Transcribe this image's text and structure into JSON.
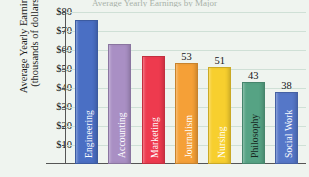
{
  "title_sliver": "Average Yearly Earnings by Major",
  "axis": {
    "ylabel_line1": "Average Yearly Earnings",
    "ylabel_line2": "(thousands of dollars)",
    "yticks": [
      "$80",
      "$70",
      "$60",
      "$50",
      "$40",
      "$30",
      "$20",
      "$10"
    ]
  },
  "chart_data": {
    "type": "bar",
    "title": "Average Yearly Earnings by Major",
    "xlabel": "",
    "ylabel": "Average Yearly Earnings (thousands of dollars)",
    "ylim": [
      0,
      80
    ],
    "ytick_values": [
      10,
      20,
      30,
      40,
      50,
      60,
      70,
      80
    ],
    "ytick_labels": [
      "$10",
      "$20",
      "$30",
      "$40",
      "$50",
      "$60",
      "$70",
      "$80"
    ],
    "grid": true,
    "legend": "none",
    "categories": [
      "Engineering",
      "Accounting",
      "Marketing",
      "Journalism",
      "Nursing",
      "Philosophy",
      "Social Work"
    ],
    "values": [
      76,
      63,
      57,
      53,
      51,
      43,
      38
    ],
    "value_labels": [
      "",
      "",
      "",
      "53",
      "51",
      "43",
      "38"
    ],
    "colors": [
      "#4a6fc4",
      "#a98fc4",
      "#ee3a4e",
      "#f5a037",
      "#f7cf2e",
      "#56a384",
      "#5577c8"
    ],
    "label_colors": [
      "#ffffff",
      "#ffffff",
      "#ffffff",
      "#ffffff",
      "#ffffff",
      "#16281f",
      "#ffffff"
    ],
    "bars": [
      {
        "category": "Engineering",
        "value": 76,
        "label": "Engineering",
        "value_label": "",
        "color": "#4a6fc4",
        "label_color": "#ffffff"
      },
      {
        "category": "Accounting",
        "value": 63,
        "label": "Accounting",
        "value_label": "",
        "color": "#a98fc4",
        "label_color": "#ffffff"
      },
      {
        "category": "Marketing",
        "value": 57,
        "label": "Marketing",
        "value_label": "",
        "color": "#ee3a4e",
        "label_color": "#ffffff"
      },
      {
        "category": "Journalism",
        "value": 53,
        "label": "Journalism",
        "value_label": "53",
        "color": "#f5a037",
        "label_color": "#ffffff"
      },
      {
        "category": "Nursing",
        "value": 51,
        "label": "Nursing",
        "value_label": "51",
        "color": "#f7cf2e",
        "label_color": "#ffffff"
      },
      {
        "category": "Philosophy",
        "value": 43,
        "label": "Philosophy",
        "value_label": "43",
        "color": "#56a384",
        "label_color": "#16281f"
      },
      {
        "category": "Social Work",
        "value": 38,
        "label": "Social Work",
        "value_label": "38",
        "color": "#5577c8",
        "label_color": "#ffffff"
      }
    ]
  }
}
